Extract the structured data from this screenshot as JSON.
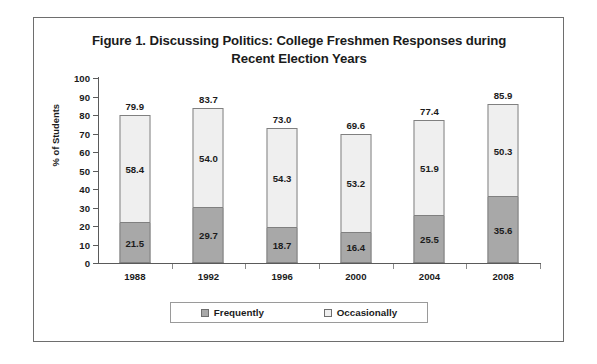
{
  "figure": {
    "title_line1": "Figure 1. Discussing Politics: College Freshmen Responses during",
    "title_line2": "Recent Election Years"
  },
  "chart_data": {
    "type": "bar",
    "subtype": "stacked-vertical",
    "title": "Figure 1. Discussing Politics: College Freshmen Responses during Recent Election Years",
    "xlabel": "",
    "ylabel": "% of Students",
    "ylim": [
      0,
      100
    ],
    "ytick_step": 10,
    "yticks": [
      100,
      90,
      80,
      70,
      60,
      50,
      40,
      30,
      20,
      10,
      0
    ],
    "grid": false,
    "legend_position": "bottom",
    "categories": [
      "1988",
      "1992",
      "1996",
      "2000",
      "2004",
      "2008"
    ],
    "series": [
      {
        "name": "Frequently",
        "color": "#a8a8a8",
        "values": [
          21.5,
          29.7,
          18.7,
          16.4,
          25.5,
          35.6
        ]
      },
      {
        "name": "Occasionally",
        "color": "#efefef",
        "values": [
          58.4,
          54.0,
          54.3,
          53.2,
          51.9,
          50.3
        ]
      }
    ],
    "totals": [
      79.9,
      83.7,
      73.0,
      69.6,
      77.4,
      85.9
    ],
    "value_labels": {
      "frequently": [
        "21.5",
        "29.7",
        "18.7",
        "16.4",
        "25.5",
        "35.6"
      ],
      "occasionally": [
        "58.4",
        "54.0",
        "54.3",
        "53.2",
        "51.9",
        "50.3"
      ],
      "totals": [
        "79.9",
        "83.7",
        "73.0",
        "69.6",
        "77.4",
        "85.9"
      ]
    }
  },
  "legend": {
    "items": [
      {
        "label": "Frequently",
        "color": "#a8a8a8"
      },
      {
        "label": "Occasionally",
        "color": "#efefef"
      }
    ]
  }
}
